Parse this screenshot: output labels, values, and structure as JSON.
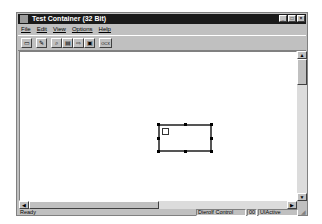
{
  "window": {
    "title": "Test Container (32 Bit)",
    "controls": [
      "minimize",
      "maximize",
      "close"
    ]
  },
  "menu": [
    "File",
    "Edit",
    "View",
    "Options",
    "Help"
  ],
  "toolbar": {
    "buttons": [
      {
        "name": "new-icon"
      },
      {
        "name": "insert-control-icon"
      },
      {
        "name": "properties-icon"
      },
      {
        "name": "invoke-methods-icon"
      },
      {
        "name": "events-icon"
      },
      {
        "name": "ambient-icon"
      },
      {
        "name": "ocx-icon",
        "label": "OCX"
      }
    ]
  },
  "status": {
    "main": "Ready",
    "control": "Dierolf Control",
    "code": "00",
    "state": "UIActive"
  }
}
